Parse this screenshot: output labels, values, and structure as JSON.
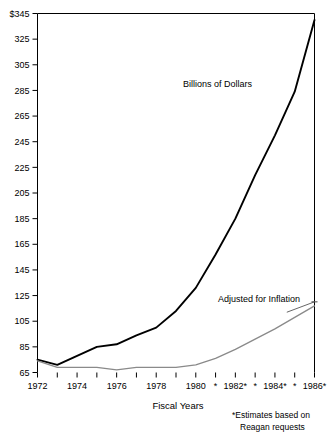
{
  "chart_data": {
    "type": "line",
    "title": "",
    "xlabel": "Fiscal Years",
    "ylabel": "",
    "x": [
      1972,
      1973,
      1974,
      1975,
      1976,
      1977,
      1978,
      1979,
      1980,
      1981,
      1982,
      1983,
      1984,
      1985,
      1986
    ],
    "xtick_labels": [
      "1972",
      "",
      "1974",
      "",
      "1976",
      "",
      "1978",
      "",
      "1980",
      "*",
      "1982*",
      "*",
      "1984*",
      "*",
      "1986*"
    ],
    "ytick_labels": [
      "65",
      "85",
      "105",
      "125",
      "145",
      "165",
      "185",
      "205",
      "225",
      "245",
      "265",
      "285",
      "305",
      "325",
      "$345"
    ],
    "ytick_values": [
      65,
      85,
      105,
      125,
      145,
      165,
      185,
      205,
      225,
      245,
      265,
      285,
      305,
      325,
      345
    ],
    "ylim": [
      65,
      345
    ],
    "xlim": [
      1972,
      1986
    ],
    "grid": false,
    "legend": "inline-annotations",
    "series": [
      {
        "name": "Billions of Dollars",
        "color": "#000000",
        "values": [
          75,
          71,
          78,
          85,
          87,
          94,
          100,
          113,
          131,
          157,
          185,
          219,
          250,
          284,
          340
        ]
      },
      {
        "name": "Adjusted for Inflation",
        "color": "#8a8a8a",
        "values": [
          74,
          69,
          69,
          69,
          67,
          69,
          69,
          69,
          71,
          76,
          83,
          91,
          99,
          108,
          117
        ]
      }
    ],
    "annotations": [
      {
        "text": "Billions of Dollars",
        "x": 1981.1,
        "y": 288
      },
      {
        "text": "Adjusted for Inflation",
        "x": 1983.2,
        "y": 120
      }
    ],
    "footnote_line1": "*Estimates based on",
    "footnote_line2": "Reagan requests"
  }
}
